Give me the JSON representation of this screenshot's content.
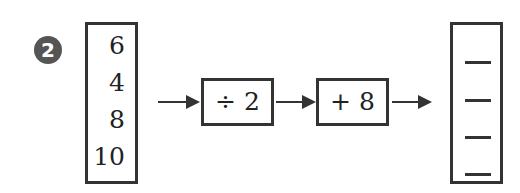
{
  "problem": {
    "number": "2",
    "inputs": [
      "6",
      "4",
      "8",
      "10"
    ],
    "operations": [
      {
        "label": "÷ 2"
      },
      {
        "label": "+ 8"
      }
    ],
    "outputs": [
      "",
      "",
      "",
      ""
    ]
  }
}
